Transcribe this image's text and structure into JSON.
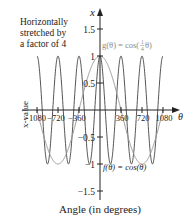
{
  "chart_data": {
    "type": "line",
    "title": "",
    "annotation": [
      "Horizontally",
      "stretched by",
      "a factor of 4"
    ],
    "xlabel": "Angle (in degrees)",
    "ylabel": "x-value",
    "x_axis_symbol": "θ",
    "y_axis_symbol": "x",
    "xlim": [
      -1080,
      1080
    ],
    "ylim": [
      -1.5,
      1.5
    ],
    "x_ticks": [
      -1080,
      -720,
      -360,
      360,
      720,
      1080
    ],
    "x_tick_labels": [
      "−1080",
      "−720",
      "−360",
      "360",
      "720",
      "1080"
    ],
    "y_ticks": [
      1.5,
      1,
      0.5,
      -0.5,
      -1,
      -1.5
    ],
    "y_tick_labels": [
      "1.5",
      "1",
      "0.5",
      "−0.5",
      "−1",
      "−1.5"
    ],
    "grid": false,
    "series": [
      {
        "name": "f(θ) = cos(θ)",
        "function": "cos(theta)",
        "factor": 1,
        "color": "#555555",
        "x": [
          -1080,
          -900,
          -720,
          -540,
          -360,
          -180,
          0,
          180,
          360,
          540,
          720,
          900,
          1080
        ],
        "values": [
          1,
          -1,
          1,
          -1,
          1,
          -1,
          1,
          -1,
          1,
          -1,
          1,
          -1,
          1
        ]
      },
      {
        "name": "g(θ) = cos(¼θ)",
        "function": "cos(theta/4)",
        "factor": 0.25,
        "color": "#999999",
        "x": [
          -1080,
          -720,
          -360,
          0,
          360,
          720,
          1080
        ],
        "values": [
          0,
          -1,
          0,
          1,
          0,
          -1,
          0
        ]
      }
    ],
    "labels": {
      "f": "f(θ) = cos(θ)",
      "g_prefix": "g(θ) = cos(",
      "g_frac_num": "1",
      "g_frac_den": "4",
      "g_suffix": "θ)"
    }
  }
}
